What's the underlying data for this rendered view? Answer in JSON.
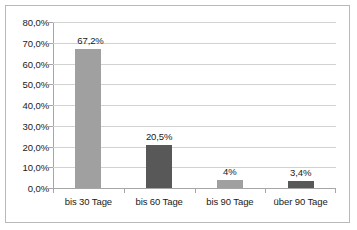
{
  "chart_data": {
    "type": "bar",
    "title": "",
    "xlabel": "",
    "ylabel": "",
    "categories": [
      "bis 30 Tage",
      "bis 60 Tage",
      "bis 90 Tage",
      "über 90 Tage"
    ],
    "values": [
      67.2,
      20.5,
      4.0,
      3.4
    ],
    "data_labels": [
      "67,2%",
      "20,5%",
      "4%",
      "3,4%"
    ],
    "bar_colors": [
      "#a0a0a0",
      "#585858",
      "#a0a0a0",
      "#585858"
    ],
    "ylim": [
      0,
      80
    ],
    "ytick_values": [
      0,
      10,
      20,
      30,
      40,
      50,
      60,
      70,
      80
    ],
    "ytick_labels": [
      "0,0%",
      "10,0%",
      "20,0%",
      "30,0%",
      "40,0%",
      "50,0%",
      "60,0%",
      "70,0%",
      "80,0%"
    ],
    "grid": true,
    "legend": false,
    "legend_position": "none",
    "decimal_separator": ","
  },
  "colors": {
    "frame": "#b9b9b9",
    "gridline": "#d2d2d2",
    "axis": "#a6a6a6",
    "text": "#1a1a1a",
    "background": "#ffffff",
    "bar_light": "#a0a0a0",
    "bar_dark": "#585858"
  }
}
